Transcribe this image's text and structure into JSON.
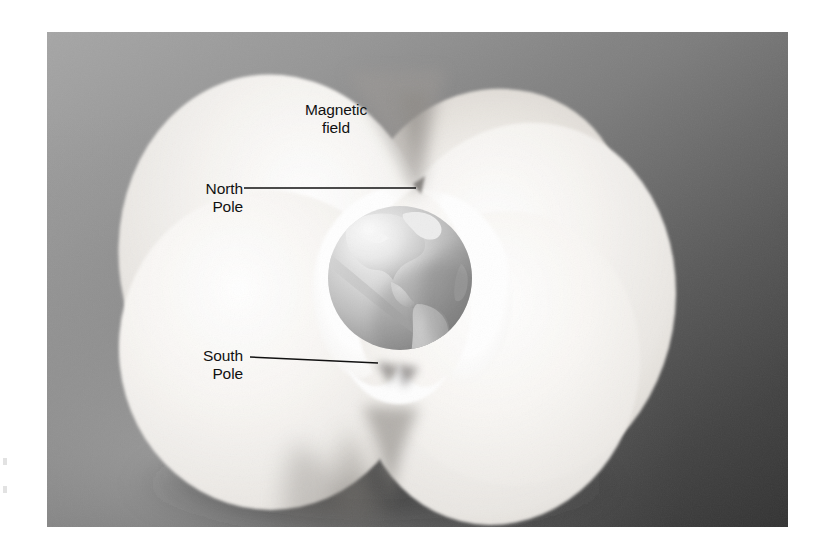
{
  "figure": {
    "panel": {
      "x": 47,
      "y": 32,
      "width": 741,
      "height": 495,
      "background_light": "#9d9d9d",
      "background_dark": "#343434"
    },
    "labels": {
      "magnetic_field": {
        "line1": "Magnetic",
        "line2": "field"
      },
      "north_pole": {
        "line1": "North",
        "line2": "Pole"
      },
      "south_pole": {
        "line1": "South",
        "line2": "Pole"
      }
    },
    "leader_lines": [
      {
        "name": "north-pole-leader",
        "from_x": 244,
        "from_y": 188,
        "to_x": 416,
        "to_y": 188
      },
      {
        "name": "south-pole-leader",
        "from_x": 250,
        "from_y": 356,
        "to_x": 377,
        "to_y": 363
      }
    ],
    "globe": {
      "center_x": 400,
      "center_y": 278,
      "radius": 72,
      "ocean_light": "#e8e8e8",
      "ocean_shadow": "#8e8e8e",
      "land": "#d5d5d5"
    },
    "lobes": {
      "fill_light": "#f2f0ee",
      "fill_white": "#fdfdfc",
      "count": 4
    }
  },
  "colors": {
    "page_background": "#ffffff",
    "label_text": "#111111",
    "leader_line": "#111111"
  }
}
